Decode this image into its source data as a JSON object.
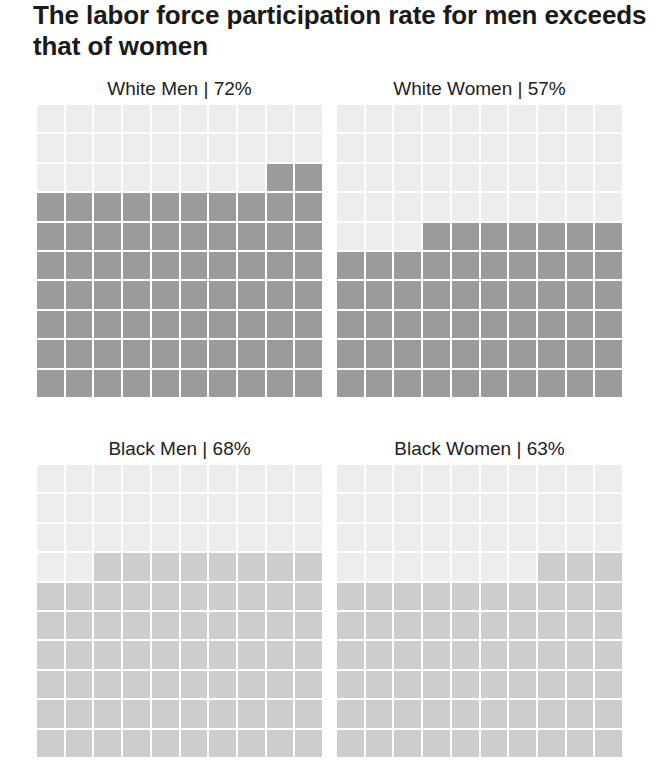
{
  "title": "The labor force participation rate for men exceeds that of women",
  "colors": {
    "empty": "#ededed",
    "white_filled": "#9b9b9b",
    "black_filled": "#cdcdcd",
    "background": "#ffffff"
  },
  "panels": [
    {
      "label": "White Men | 72%",
      "group": "White Men",
      "percent": 72,
      "shade": "dark"
    },
    {
      "label": "White Women | 57%",
      "group": "White Women",
      "percent": 57,
      "shade": "dark"
    },
    {
      "label": "Black Men | 68%",
      "group": "Black Men",
      "percent": 68,
      "shade": "light"
    },
    {
      "label": "Black Women | 63%",
      "group": "Black Women",
      "percent": 63,
      "shade": "light"
    }
  ],
  "chart_data": {
    "type": "waffle",
    "title": "The labor force participation rate for men exceeds that of women",
    "grid": {
      "rows": 10,
      "cols": 10,
      "fill_order": "bottom-up, right-to-left within partial row"
    },
    "categories": [
      "White Men",
      "White Women",
      "Black Men",
      "Black Women"
    ],
    "values": [
      72,
      57,
      68,
      63
    ],
    "unit": "%",
    "layout": "2x2 small multiples",
    "legend": null,
    "xlabel": "",
    "ylabel": ""
  }
}
